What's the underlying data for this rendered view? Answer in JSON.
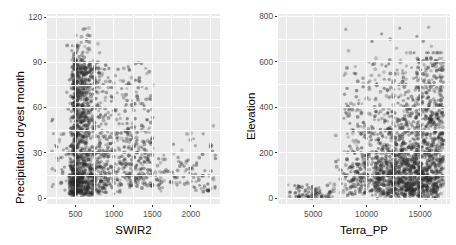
{
  "figure": {
    "type": "scatter-matrix",
    "background_color": "#ffffff",
    "panel_color": "#EBEBEB",
    "grid_color": "#FFFFFF",
    "point_color": "#2B2B2B",
    "tick_text_color": "#4D4D4D",
    "axis_title_color": "#000000",
    "panel_count": 2
  },
  "chart_data": [
    {
      "type": "scatter",
      "id": "swir2-precipitation",
      "title": "",
      "xlabel": "SWIR2",
      "ylabel": "Precipitation dryest month",
      "xlim": [
        130,
        2380
      ],
      "ylim": [
        -4,
        122
      ],
      "xticks": [
        500,
        1000,
        1500,
        2000
      ],
      "xtick_labels": [
        "500",
        "1000",
        "1500",
        "2000"
      ],
      "yticks": [
        0,
        30,
        60,
        90,
        120
      ],
      "ytick_labels": [
        "0",
        "30",
        "60",
        "90",
        "120"
      ],
      "grid": true,
      "minor_grid": true,
      "legend": "none",
      "point_alpha": 0.35,
      "point_size": 3.4,
      "n_points": 1700,
      "description": "Dense L-shaped cloud: a tall vertical plume near SWIR2 500-750 spanning precipitation 5-105, decaying to a long low tail from SWIR2 900 to 2300 at precipitation 5-35.",
      "x": [],
      "y": []
    },
    {
      "type": "scatter",
      "id": "terrapp-elevation",
      "title": "",
      "xlabel": "Terra_PP",
      "ylabel": "Elevation",
      "xlim": [
        1700,
        17800
      ],
      "ylim": [
        -25,
        810
      ],
      "xticks": [
        5000,
        10000,
        15000
      ],
      "xtick_labels": [
        "5000",
        "10000",
        "15000"
      ],
      "yticks": [
        0,
        200,
        400,
        600,
        800
      ],
      "ytick_labels": [
        "0",
        "200",
        "400",
        "600",
        "800"
      ],
      "grid": true,
      "minor_grid": true,
      "legend": "none",
      "point_alpha": 0.35,
      "point_size": 3.4,
      "n_points": 1700,
      "description": "Sparse scatter below Terra_PP 6500 near elevation 0-60; dense wedge from Terra_PP 7000 to 17000 fanning upward, bulk between elevation 0 and 400, thinning above 500, a few outliers near elevation 650-760.",
      "x": [],
      "y": []
    }
  ]
}
